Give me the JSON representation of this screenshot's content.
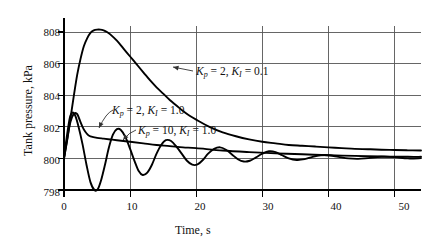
{
  "chart_data": {
    "type": "line",
    "title": "",
    "xlabel": "Time, s",
    "ylabel": "Tank pressure, kPa",
    "xlim": [
      0,
      54
    ],
    "ylim": [
      798,
      808.6
    ],
    "xticks": [
      0,
      10,
      20,
      30,
      40,
      50
    ],
    "xtick_labels": [
      "0",
      "10",
      "20",
      "30",
      "40",
      "50"
    ],
    "yticks": [
      798,
      800,
      802,
      804,
      806,
      808
    ],
    "ytick_labels": [
      "798",
      "800",
      "802",
      "804",
      "806",
      "808"
    ],
    "grid": true,
    "legend": "annotations-with-leader-arrows",
    "series": [
      {
        "name": "Kp = 2, KI = 0.1",
        "Kp": 2,
        "KI": 0.1,
        "x": [
          0,
          0.5,
          1,
          1.5,
          2,
          2.5,
          3,
          3.5,
          4,
          4.5,
          5,
          5.5,
          6,
          6.5,
          7,
          8,
          9,
          10,
          11,
          12,
          13,
          14,
          15,
          16,
          17,
          18,
          19,
          20,
          22,
          24,
          26,
          28,
          30,
          32,
          34,
          36,
          38,
          40,
          42,
          44,
          46,
          48,
          50,
          52,
          54
        ],
        "y": [
          800.0,
          801.2,
          802.6,
          804.0,
          805.3,
          806.3,
          807.1,
          807.6,
          807.95,
          808.1,
          808.15,
          808.15,
          808.1,
          808.0,
          807.85,
          807.45,
          806.95,
          806.45,
          805.95,
          805.45,
          804.95,
          804.5,
          804.1,
          803.7,
          803.35,
          803.0,
          802.7,
          802.45,
          802.0,
          801.65,
          801.4,
          801.2,
          801.05,
          800.95,
          800.85,
          800.8,
          800.75,
          800.7,
          800.65,
          800.6,
          800.58,
          800.55,
          800.53,
          800.51,
          800.5
        ]
      },
      {
        "name": "Kp = 2, KI = 1.0",
        "Kp": 2,
        "KI": 1.0,
        "x": [
          0,
          0.4,
          0.8,
          1.2,
          1.6,
          2.0,
          2.4,
          2.8,
          3.2,
          3.6,
          4.0,
          5,
          6,
          7,
          8,
          10,
          12,
          14,
          16,
          18,
          20,
          24,
          28,
          32,
          36,
          40,
          44,
          48,
          52,
          54
        ],
        "y": [
          800.0,
          801.0,
          802.0,
          802.6,
          802.85,
          802.8,
          802.4,
          802.0,
          801.7,
          801.5,
          801.4,
          801.3,
          801.25,
          801.2,
          801.15,
          801.05,
          800.95,
          800.85,
          800.78,
          800.7,
          800.65,
          800.5,
          800.4,
          800.32,
          800.26,
          800.2,
          800.16,
          800.12,
          800.1,
          800.1
        ]
      },
      {
        "name": "Kp = 10, KI = 1.0",
        "Kp": 10,
        "KI": 1.0,
        "x": [
          0,
          0.4,
          0.9,
          1.3,
          1.7,
          2.2,
          2.8,
          3.4,
          4.0,
          4.6,
          5.1,
          5.6,
          6.2,
          6.8,
          7.4,
          8.0,
          8.6,
          9.3,
          10.0,
          10.7,
          11.3,
          11.9,
          12.6,
          13.3,
          14.0,
          14.7,
          15.4,
          16.2,
          17.0,
          17.8,
          18.6,
          19.4,
          20.2,
          21.0,
          21.8,
          22.7,
          23.6,
          24.5,
          25.4,
          26.3,
          27.2,
          28.1,
          29.0,
          30.0,
          31.0,
          32.0,
          33.0,
          34.0,
          35.2,
          36.4,
          37.6,
          38.8,
          40.0,
          41.5,
          43.0,
          44.5,
          46.0,
          48.0,
          50.0,
          52.0,
          54.0
        ],
        "y": [
          800.0,
          801.3,
          802.6,
          802.9,
          802.7,
          802.0,
          800.9,
          799.6,
          798.5,
          798.0,
          798.05,
          798.6,
          799.6,
          800.7,
          801.5,
          801.85,
          801.8,
          801.35,
          800.6,
          799.8,
          799.2,
          798.95,
          799.1,
          799.6,
          800.3,
          800.85,
          801.15,
          801.1,
          800.75,
          800.3,
          799.85,
          799.6,
          799.62,
          799.9,
          800.3,
          800.6,
          800.7,
          800.55,
          800.25,
          799.95,
          799.8,
          799.85,
          800.05,
          800.3,
          800.45,
          800.4,
          800.2,
          800.0,
          799.9,
          799.95,
          800.1,
          800.2,
          800.2,
          800.1,
          800.0,
          799.97,
          800.02,
          800.1,
          800.08,
          800.0,
          800.02
        ]
      }
    ],
    "annotations": [
      {
        "id": "annot-1",
        "text": "Kp = 2, KI = 0.1",
        "symbol_prefix": "K",
        "sub_p": "p",
        "value_p": "2",
        "sub_i": "I",
        "value_i": "0.1"
      },
      {
        "id": "annot-2",
        "text": "Kp = 2, KI = 1.0",
        "symbol_prefix": "K",
        "sub_p": "p",
        "value_p": "2",
        "sub_i": "I",
        "value_i": "1.0"
      },
      {
        "id": "annot-3",
        "text": "Kp = 10, KI = 1.0",
        "symbol_prefix": "K",
        "sub_p": "p",
        "value_p": "10",
        "sub_i": "I",
        "value_i": "1.0"
      }
    ],
    "colors": {
      "curve": "#000000",
      "grid": "#555555",
      "axis": "#000000",
      "background": "#ffffff",
      "leader": "#333333"
    }
  },
  "axis": {
    "y_title": "Tank pressure, kPa",
    "x_title": "Time, s",
    "ytick_0": "798",
    "ytick_1": "800",
    "ytick_2": "802",
    "ytick_3": "804",
    "ytick_4": "806",
    "ytick_5": "808",
    "xtick_0": "0",
    "xtick_1": "10",
    "xtick_2": "20",
    "xtick_3": "30",
    "xtick_4": "40",
    "xtick_5": "50"
  },
  "annot_parts": {
    "a1_k": "K",
    "a1_psub": "p",
    "a1_eq1": " = 2, ",
    "a1_k2": "K",
    "a1_isub": "I",
    "a1_eq2": " = 0.1",
    "a2_k": "K",
    "a2_psub": "p",
    "a2_eq1": " = 2, ",
    "a2_k2": "K",
    "a2_isub": "I",
    "a2_eq2": " = 1.0",
    "a3_k": "K",
    "a3_psub": "p",
    "a3_eq1": " = 10, ",
    "a3_k2": "K",
    "a3_isub": "I",
    "a3_eq2": " = 1.0"
  }
}
